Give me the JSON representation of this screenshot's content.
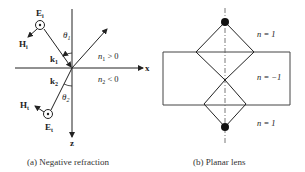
{
  "panel_a": {
    "caption": "(a) Negative refraction",
    "incident": {
      "E_label": "E",
      "E_sub": "i",
      "H_label": "H",
      "H_sub": "i",
      "k_label": "k",
      "k_sub": "1",
      "angle_label": "θ",
      "angle_sub": "1"
    },
    "transmitted": {
      "E_label": "E",
      "E_sub": "t",
      "H_label": "H",
      "H_sub": "t",
      "k_label": "k",
      "k_sub": "2",
      "angle_label": "θ",
      "angle_sub": "2"
    },
    "axes": {
      "x_label": "x",
      "z_label": "z"
    },
    "media": {
      "upper": "n",
      "upper_sub": "1",
      "upper_rel": " > 0",
      "lower": "n",
      "lower_sub": "2",
      "lower_rel": " < 0"
    }
  },
  "panel_b": {
    "caption": "(b) Planar lens",
    "regions": [
      {
        "label": "n = 1"
      },
      {
        "label": "n = −1"
      },
      {
        "label": "n = 1"
      }
    ]
  }
}
